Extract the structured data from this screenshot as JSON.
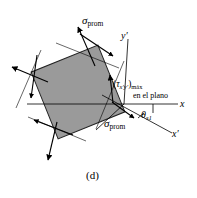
{
  "figure": {
    "caption": "(d)",
    "background_color": "#ffffff",
    "element_fill_color": "#9a9a9a",
    "element_stroke_color": "#000000",
    "line_color": "#000000"
  },
  "labels": {
    "sigma_top": {
      "symbol": "σ",
      "subscript": "prom"
    },
    "sigma_bottom": {
      "symbol": "σ",
      "subscript": "prom"
    },
    "tau_max": {
      "open_paren": "(",
      "symbol": "τ",
      "subscript_axes": "x′y′",
      "close_paren": ")",
      "subscript_max": "máx",
      "second_line": "en el plano"
    },
    "theta": {
      "symbol": "θ",
      "subscript": "s1"
    },
    "axis_x": "x",
    "axis_x_prime": "x′",
    "axis_y_prime": "y′"
  },
  "geometry": {
    "square_rotation_deg": -22,
    "square_center": [
      78,
      92
    ],
    "square_size": 72,
    "origin": [
      124,
      104
    ],
    "axis_x_angle_deg": 0,
    "axis_xprime_angle_deg": 22,
    "axis_yprime_angle_deg": -68
  }
}
